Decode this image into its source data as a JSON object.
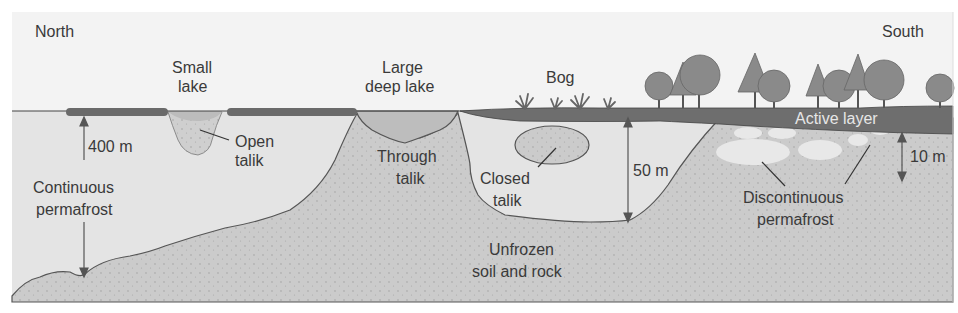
{
  "diagram": {
    "directions": {
      "north": "North",
      "south": "South"
    },
    "surface_features": {
      "small_lake": {
        "line1": "Small",
        "line2": "lake"
      },
      "large_lake": {
        "line1": "Large",
        "line2": "deep lake"
      },
      "bog": "Bog"
    },
    "layers": {
      "active_layer": "Active layer",
      "continuous": {
        "line1": "Continuous",
        "line2": "permafrost"
      },
      "discontinuous": {
        "line1": "Discontinuous",
        "line2": "permafrost"
      },
      "unfrozen": {
        "line1": "Unfrozen",
        "line2": "soil and rock"
      }
    },
    "taliks": {
      "open": {
        "line1": "Open",
        "line2": "talik"
      },
      "through": {
        "line1": "Through",
        "line2": "talik"
      },
      "closed": {
        "line1": "Closed",
        "line2": "talik"
      }
    },
    "measurements": {
      "continuous_depth": "400 m",
      "bog_depth": "50 m",
      "discontinuous_depth": "10 m"
    },
    "colors": {
      "sky": "#f3f3f3",
      "permafrost": "#e2e2e2",
      "unfrozen": "#c9c9c9",
      "lake_water": "#b8b8b8",
      "active_layer": "#6e6e6e",
      "vegetation": "#8a8a8a",
      "outline": "#4a4a4a"
    }
  }
}
